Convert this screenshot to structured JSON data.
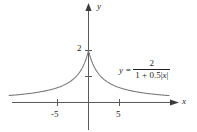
{
  "figure": {
    "axes": {
      "x_label": "x",
      "y_label": "y"
    },
    "tick_labels": {
      "x_neg5": "-5",
      "x_pos5": "5",
      "y_2": "2"
    },
    "equation": {
      "lhs": "y =",
      "numerator": "2",
      "denominator_a": "1 + 0.5",
      "denominator_abs_open": "|",
      "denominator_var": "x",
      "denominator_abs_close": "|"
    },
    "colors": {
      "background": "#ffffff",
      "ink": "#231f20",
      "curve": "#6e6e6e",
      "axis": "#5a5a5a"
    }
  },
  "chart_data": {
    "type": "line",
    "xlabel": "x",
    "ylabel": "y",
    "xlim": [
      -13.0,
      13.2
    ],
    "ylim": [
      -0.2,
      2.6
    ],
    "grid": false,
    "legend": null,
    "annotations": [
      {
        "text": "y = 2 / (1 + 0.5|x|)",
        "x": 5.0,
        "y": 1.55
      }
    ],
    "xticks": [
      -5,
      5
    ],
    "xticklabels": [
      "-5",
      "5"
    ],
    "yticks": [
      1,
      2
    ],
    "yticklabels": [
      "",
      "2"
    ],
    "series": [
      {
        "name": "y = 2/(1 + 0.5|x|)",
        "x": [
          -12.8,
          -12.0,
          -11.0,
          -10.0,
          -9.0,
          -8.0,
          -7.0,
          -6.0,
          -5.0,
          -4.0,
          -3.0,
          -2.5,
          -2.0,
          -1.5,
          -1.0,
          -0.5,
          0.0,
          0.5,
          1.0,
          1.5,
          2.0,
          2.5,
          3.0,
          4.0,
          5.0,
          6.0,
          7.0,
          8.0,
          9.0,
          10.0,
          11.0,
          12.0,
          13.0
        ],
        "y": [
          0.27,
          0.286,
          0.308,
          0.333,
          0.364,
          0.4,
          0.444,
          0.5,
          0.571,
          0.667,
          0.8,
          0.889,
          1.0,
          1.143,
          1.333,
          1.6,
          2.0,
          1.6,
          1.333,
          1.143,
          1.0,
          0.889,
          0.8,
          0.667,
          0.571,
          0.5,
          0.444,
          0.4,
          0.364,
          0.333,
          0.308,
          0.286,
          0.267
        ]
      }
    ]
  }
}
